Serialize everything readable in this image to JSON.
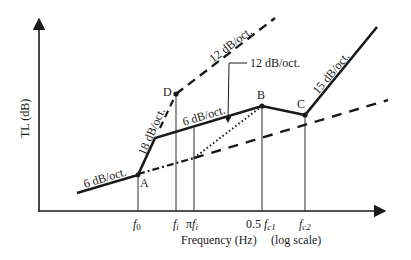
{
  "diagram": {
    "y_axis": {
      "label": "TL (dB)"
    },
    "x_axis": {
      "label": "Frequency (Hz)",
      "scale_note": "(log scale)",
      "ticks": [
        {
          "id": "f0",
          "main": "f",
          "sub": "0"
        },
        {
          "id": "fi",
          "main": "f",
          "sub": "i"
        },
        {
          "id": "pifi",
          "prefix": "π",
          "main": "f",
          "sub": "i"
        },
        {
          "id": "fc1",
          "prefix": "0.5 ",
          "main": "f",
          "sub": "c1"
        },
        {
          "id": "fc2",
          "main": "f",
          "sub": "c2"
        }
      ]
    },
    "points": {
      "A": "A",
      "B": "B",
      "C": "C",
      "D": "D"
    },
    "slope_labels": {
      "low": "6 dB/oct.",
      "steep": "18 dB/oct.",
      "mid": "6 dB/oct.",
      "upper_dashed": "12 dB/oct.",
      "callout": "12 dB/oct.",
      "high": "15 dB/oct."
    },
    "colors": {
      "line": "#1a1a1a",
      "background": "#ffffff"
    }
  }
}
